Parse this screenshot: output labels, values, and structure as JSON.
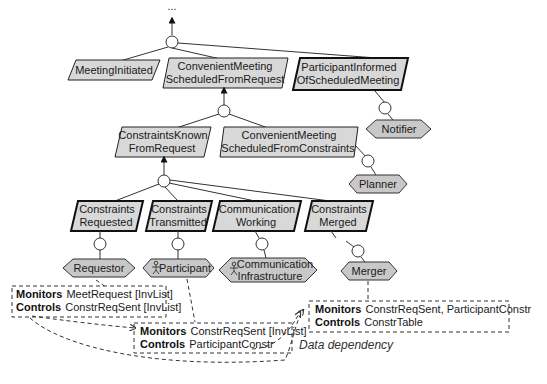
{
  "diagram": {
    "top_ellipsis": "...",
    "goals": {
      "meeting_initiated": {
        "lines": [
          "MeetingInitiated"
        ]
      },
      "conv_from_request": {
        "lines": [
          "ConvenientMeeting",
          "ScheduledFromRequest"
        ]
      },
      "participant_informed": {
        "lines": [
          "ParticipantInformed",
          "OfScheduledMeeting"
        ]
      },
      "constraints_known": {
        "lines": [
          "ConstraintsKnown",
          "FromRequest"
        ]
      },
      "conv_from_constraints": {
        "lines": [
          "ConvenientMeeting",
          "ScheduledFromConstraints"
        ]
      },
      "constraints_requested": {
        "lines": [
          "Constraints",
          "Requested"
        ]
      },
      "constraints_transmitted": {
        "lines": [
          "Constraints",
          "Transmitted"
        ]
      },
      "communication_working": {
        "lines": [
          "Communication",
          "Working"
        ]
      },
      "constraints_merged": {
        "lines": [
          "Constraints",
          "Merged"
        ]
      }
    },
    "agents": {
      "notifier": {
        "lines": [
          "Notifier"
        ]
      },
      "planner": {
        "lines": [
          "Planner"
        ]
      },
      "requestor": {
        "lines": [
          "Requestor"
        ]
      },
      "participant": {
        "lines": [
          "Participant"
        ],
        "human": true
      },
      "comm_infra": {
        "lines": [
          "Communication",
          "Infrastructure"
        ],
        "human": true
      },
      "merger": {
        "lines": [
          "Merger"
        ]
      }
    },
    "interfaces": {
      "requestor": {
        "monitors_kw": "Monitors",
        "monitors": "MeetRequest [InvList]",
        "controls_kw": "Controls",
        "controls": "ConstrReqSent [InvList]"
      },
      "participant": {
        "monitors_kw": "Monitors",
        "monitors": "ConstrReqSent [InvList]",
        "controls_kw": "Controls",
        "controls": "ParticipantConstr"
      },
      "merger": {
        "monitors_kw": "Monitors",
        "monitors": "ConstrReqSent, ParticipantConstr",
        "controls_kw": "Controls",
        "controls": "ConstrTable"
      }
    },
    "legend": {
      "data_dependency": "Data dependency"
    }
  }
}
